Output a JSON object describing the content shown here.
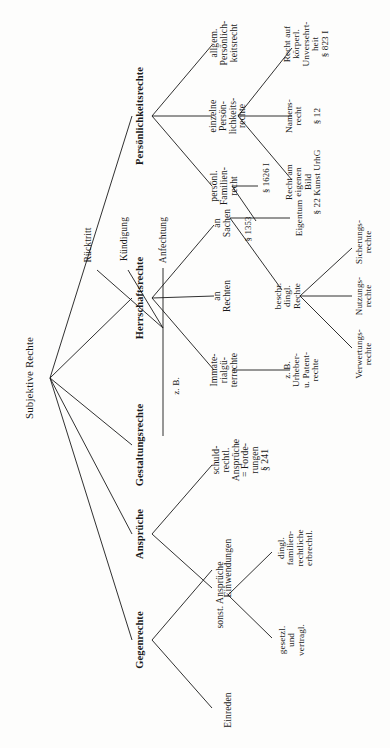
{
  "diagram": {
    "title": "Subjektive Rechte",
    "orientation": "rotated-90",
    "root": {
      "label": "Subjektive Rechte"
    },
    "branches": {
      "persoenlichkeitsrechte": {
        "label": "Persönlichkeitsrechte",
        "children": [
          {
            "label": "allgem.\nPersönlich-\nkeitsrecht"
          },
          {
            "label": "einzelne\nPersön-\nlichkeits-\nrechte"
          },
          {
            "label": "persönl.\nFamilien-\nrecht"
          }
        ],
        "grandchildren": [
          {
            "label": "Recht auf\nkörperl.\nUnversehrt-\nheit\n§ 823 I"
          },
          {
            "label": "Namens-\nrecht\n\n§ 12"
          },
          {
            "label": "Recht am\neigenen\nBild\n§ 22 Kunst UrhG"
          },
          {
            "label": "§ 1626 I"
          },
          {
            "label": "§ 1353"
          }
        ]
      },
      "herrschaftsrechte": {
        "label": "Herrschaftsrechte",
        "children": [
          {
            "label": "an\nSachen"
          },
          {
            "label": "an\nRechten"
          },
          {
            "label": "Immate-\nrialgü-\nterrechte"
          }
        ],
        "grandchildren": [
          {
            "label": "Eigentum"
          },
          {
            "label": "beschr.\ndingl.\nRechte"
          },
          {
            "label": "z. B.\nUrheber-\nu. Patent-\nrechte"
          }
        ],
        "greatgrandchildren": [
          {
            "label": "Sicherungs-\nrechte"
          },
          {
            "label": "Nutzungs-\nrechte"
          },
          {
            "label": "Verwertungs-\nrechte"
          }
        ]
      },
      "gestaltungsrechte": {
        "label": "Gestaltungsrechte",
        "connector": "z. B.",
        "children": [
          {
            "label": "Anfechtung"
          },
          {
            "label": "Kündigung"
          },
          {
            "label": "Rücktritt"
          }
        ]
      },
      "ansprueche": {
        "label": "Ansprüche",
        "children": [
          {
            "label": "schuld-\nrechtl.\nAnsprüche\n= Forde-\nrungen\n§ 241"
          },
          {
            "label": "sonst. Ansprüche"
          }
        ],
        "grandchildren": [
          {
            "label": "dingl.\nfamilien-\nrechtliche\nerbrechtl."
          },
          {
            "label": "gesetzl.\nund\nvertragl."
          }
        ]
      },
      "gegenrechte": {
        "label": "Gegenrechte",
        "children": [
          {
            "label": "Einwendungen"
          },
          {
            "label": "Einreden"
          }
        ]
      }
    },
    "colors": {
      "ink": "#1a1a1a",
      "paper": "#fdfdfc"
    }
  }
}
